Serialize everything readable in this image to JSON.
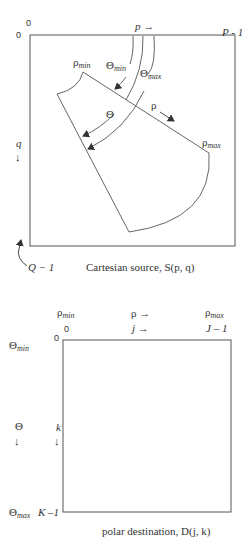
{
  "source_panel": {
    "caption": "Cartesian source, S(p, q)",
    "origin_x_label": "0",
    "origin_y_label": "0",
    "x_axis_label": "p →",
    "x_end_label": "P - 1",
    "y_axis_var": "q",
    "y_axis_arrow": "↓",
    "y_end_label": "Q − 1",
    "wedge": {
      "rho_min_base": "ρ",
      "rho_min_sub": "min",
      "rho_max_base": "ρ",
      "rho_max_sub": "max",
      "rho_label": "ρ",
      "theta_label": "Θ",
      "theta_min_base": "Θ",
      "theta_min_sub": "min",
      "theta_max_base": "Θ",
      "theta_max_sub": "max"
    }
  },
  "destination_panel": {
    "caption": "polar destination, D(j, k)",
    "col_header_rho_min_base": "ρ",
    "col_header_rho_min_sub": "min",
    "col_header_rho": "ρ →",
    "col_header_rho_max_base": "ρ",
    "col_header_rho_max_sub": "max",
    "col_index_start": "0",
    "col_index_axis": "j →",
    "col_index_end": "J – 1",
    "row_header_theta_min_base": "Θ",
    "row_header_theta_min_sub": "min",
    "row_header_theta": "Θ",
    "row_header_theta_arrow": "↓",
    "row_header_theta_max_base": "Θ",
    "row_header_theta_max_sub": "max",
    "row_index_start": "0",
    "row_index_axis": "k",
    "row_index_arrow": "↓",
    "row_index_end": "K –1"
  },
  "colors": {
    "line": "#555555",
    "text": "#333333",
    "background": "#ffffff"
  }
}
